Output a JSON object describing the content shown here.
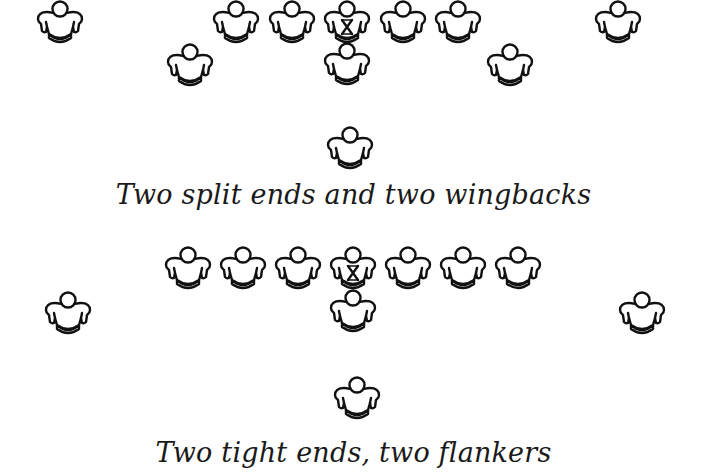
{
  "colors": {
    "ink": "#111111",
    "background": "#ffffff"
  },
  "formations": [
    {
      "caption": "Two split ends and two wingbacks",
      "caption_top": 179,
      "players": [
        {
          "role": "split-end-left",
          "x": 60,
          "y": 0
        },
        {
          "role": "lineman",
          "x": 236,
          "y": 0
        },
        {
          "role": "lineman",
          "x": 292,
          "y": 0
        },
        {
          "role": "center",
          "x": 347,
          "y": 0,
          "marked": true
        },
        {
          "role": "lineman",
          "x": 403,
          "y": 0
        },
        {
          "role": "lineman",
          "x": 458,
          "y": 0
        },
        {
          "role": "split-end-right",
          "x": 618,
          "y": 0
        },
        {
          "role": "wingback-left",
          "x": 190,
          "y": 43
        },
        {
          "role": "quarterback",
          "x": 347,
          "y": 42
        },
        {
          "role": "wingback-right",
          "x": 510,
          "y": 43
        },
        {
          "role": "fullback",
          "x": 350,
          "y": 126
        }
      ]
    },
    {
      "caption": "Two tight ends, two flankers",
      "caption_top": 437,
      "players": [
        {
          "role": "tight-end-left",
          "x": 188,
          "y": 246
        },
        {
          "role": "lineman",
          "x": 243,
          "y": 246
        },
        {
          "role": "lineman",
          "x": 298,
          "y": 246
        },
        {
          "role": "center",
          "x": 353,
          "y": 246,
          "marked": true
        },
        {
          "role": "lineman",
          "x": 408,
          "y": 246
        },
        {
          "role": "lineman",
          "x": 463,
          "y": 246
        },
        {
          "role": "tight-end-right",
          "x": 518,
          "y": 246
        },
        {
          "role": "flanker-left",
          "x": 68,
          "y": 291
        },
        {
          "role": "quarterback",
          "x": 353,
          "y": 289
        },
        {
          "role": "flanker-right",
          "x": 642,
          "y": 291
        },
        {
          "role": "fullback",
          "x": 357,
          "y": 376
        }
      ]
    }
  ],
  "icons": {
    "player": "player-jersey-icon",
    "snap": "x-mark-icon"
  }
}
